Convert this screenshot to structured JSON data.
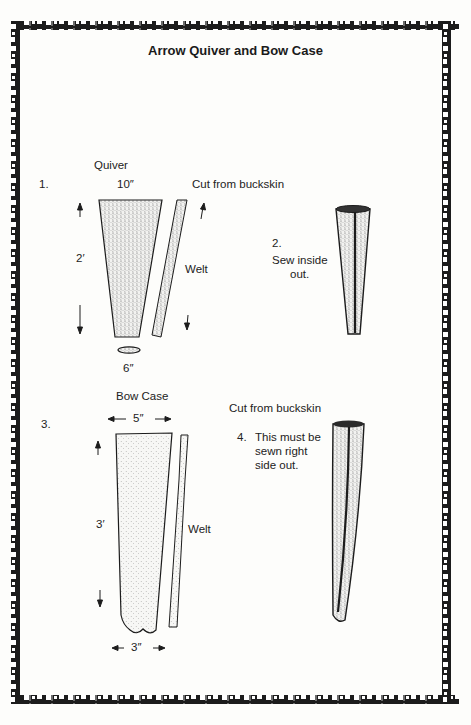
{
  "title": "Arrow Quiver and Bow Case",
  "quiver": {
    "step_number": "1.",
    "label": "Quiver",
    "top_width": "10″",
    "length": "2′",
    "bottom_width": "6″",
    "material_note": "Cut from buckskin",
    "welt_label": "Welt"
  },
  "quiver_sewn": {
    "step_number": "2.",
    "instruction_line1": "Sew inside",
    "instruction_line2": "out."
  },
  "bow_case": {
    "step_number": "3.",
    "label": "Bow Case",
    "top_width": "5″",
    "length": "3′",
    "bottom_width": "3″",
    "material_note": "Cut from buckskin",
    "welt_label": "Welt"
  },
  "bow_case_sewn": {
    "step_number": "4.",
    "instruction_line1": "This must be",
    "instruction_line2": "sewn right",
    "instruction_line3": "side out."
  },
  "colors": {
    "ink": "#1c1c1c",
    "paper": "#fdfdfb",
    "stipple": "#8a8a8a"
  }
}
